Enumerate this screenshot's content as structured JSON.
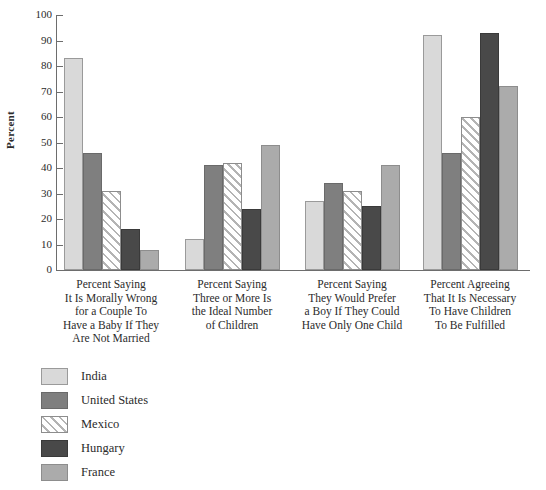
{
  "chart_data": {
    "type": "bar",
    "title": "",
    "subtitle": "",
    "xlabel": "",
    "ylabel": "Percent",
    "ylim": [
      0,
      100
    ],
    "ytick_step": 10,
    "yticks": [
      "100",
      "90",
      "80",
      "70",
      "60",
      "50",
      "40",
      "30",
      "20",
      "10",
      "0"
    ],
    "grid": false,
    "legend_position": "below-left",
    "categories": [
      "Percent Saying It Is Morally Wrong for a Couple To Have a Baby If They Are Not Married",
      "Percent Saying Three or More Is the Ideal Number of Children",
      "Percent Saying They Would Prefer a Boy If They Could Have Only One Child",
      "Percent Agreeing That It Is Necessary To Have Children To Be Fulfilled"
    ],
    "category_lines": [
      [
        "Percent Saying",
        "It Is Morally Wrong",
        "for a Couple To",
        "Have a Baby If They",
        "Are Not Married"
      ],
      [
        "Percent Saying",
        "Three or More Is",
        "the Ideal Number",
        "of Children"
      ],
      [
        "Percent Saying",
        "They Would Prefer",
        "a Boy If They Could",
        "Have Only One Child"
      ],
      [
        "Percent Agreeing",
        "That It Is Necessary",
        "To Have Children",
        "To Be Fulfilled"
      ]
    ],
    "series": [
      {
        "name": "India",
        "color": "#d9d9d9",
        "pattern": "solid",
        "values": [
          83,
          12,
          27,
          92
        ]
      },
      {
        "name": "United States",
        "color": "#7f7f7f",
        "pattern": "solid",
        "values": [
          46,
          41,
          34,
          46
        ]
      },
      {
        "name": "Mexico",
        "color": "#ffffff",
        "pattern": "hatch",
        "values": [
          31,
          42,
          31,
          60
        ]
      },
      {
        "name": "Hungary",
        "color": "#494949",
        "pattern": "solid",
        "values": [
          16,
          24,
          25,
          93
        ]
      },
      {
        "name": "France",
        "color": "#ababab",
        "pattern": "solid",
        "values": [
          8,
          49,
          41,
          72
        ]
      }
    ]
  }
}
